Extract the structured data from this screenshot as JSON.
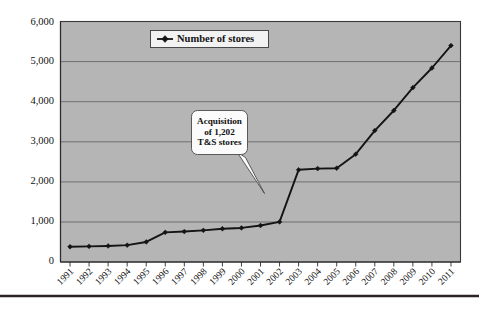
{
  "chart_data": {
    "type": "line",
    "title": "",
    "subtitle": "",
    "xlabel": "",
    "ylabel": "",
    "grid": true,
    "legend_position": "top-center",
    "plot_background": "#b5b5b5",
    "series_color": "#141414",
    "ylim": [
      0,
      6000
    ],
    "ytick_labels": [
      "0",
      "1,000",
      "2,000",
      "3,000",
      "4,000",
      "5,000",
      "6,000"
    ],
    "ytick_values": [
      0,
      1000,
      2000,
      3000,
      4000,
      5000,
      6000
    ],
    "categories": [
      "1991",
      "1992",
      "1993",
      "1994",
      "1995",
      "1996",
      "1997",
      "1998",
      "1999",
      "2000",
      "2001",
      "2002",
      "2003",
      "2004",
      "2005",
      "2006",
      "2007",
      "2008",
      "2009",
      "2010",
      "2011"
    ],
    "series": [
      {
        "name": "Number of stores",
        "values": [
          380,
          390,
          400,
          420,
          500,
          740,
          760,
          790,
          830,
          850,
          910,
          1000,
          2300,
          2330,
          2340,
          2690,
          3280,
          3780,
          4350,
          4840,
          5400
        ]
      }
    ],
    "annotations": [
      {
        "name": "acquisition-callout",
        "lines": [
          "Acquisition",
          "of 1,202",
          "T&S stores"
        ],
        "points_to_category": "2002"
      }
    ]
  },
  "legend": {
    "entries": [
      {
        "label": "Number of stores",
        "marker": "diamond-marker"
      }
    ]
  },
  "callout": {
    "line1": "Acquisition",
    "line2": "of 1,202",
    "line3": "T&S stores"
  }
}
